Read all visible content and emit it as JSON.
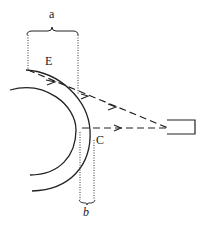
{
  "diagram": {
    "labels": {
      "a": "a",
      "b": "b",
      "E": "E",
      "C": "C"
    },
    "colors": {
      "stroke": "#222222",
      "background": "#ffffff"
    },
    "elements": {
      "outer_arc": "outer-shell-arc",
      "inner_arc": "inner-shell-arc",
      "upper_ray": "dashed ray from E region to detector",
      "lower_ray": "dashed ray from C to detector",
      "detector": "rectangular-detector",
      "brace_a": "width a bracket",
      "brace_b": "width b bracket"
    }
  }
}
